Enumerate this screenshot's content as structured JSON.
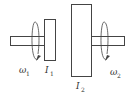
{
  "diagram": {
    "title": "",
    "components": [
      {
        "id": "shaft-left",
        "kind": "shaft"
      },
      {
        "id": "disk-1",
        "kind": "disk",
        "label": "I",
        "subscript": "1"
      },
      {
        "id": "disk-2",
        "kind": "disk",
        "label": "I",
        "subscript": "2"
      },
      {
        "id": "shaft-right",
        "kind": "shaft"
      }
    ],
    "rotations": [
      {
        "id": "rotation-left",
        "label": "ω",
        "subscript": "1"
      },
      {
        "id": "rotation-right",
        "label": "ω",
        "subscript": "2"
      }
    ],
    "colors": {
      "stroke": "#444444",
      "text": "#333333",
      "background": "#ffffff"
    }
  }
}
